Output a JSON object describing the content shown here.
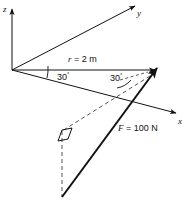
{
  "figure": {
    "background_color": "#ffffff",
    "line_color": "#111111",
    "axes": [
      {
        "name": "z-axis",
        "label": "z",
        "label_x": 4,
        "label_y": 6,
        "x1": 12,
        "y1": 70,
        "x2": 12,
        "y2": 9,
        "arrow": true,
        "dashed": false
      },
      {
        "name": "y-axis",
        "label": "y",
        "label_x": 137,
        "label_y": 9,
        "x1": 12,
        "y1": 70,
        "x2": 135,
        "y2": 6,
        "arrow": true,
        "dashed": false
      },
      {
        "name": "x-axis",
        "label": "x",
        "label_x": 178,
        "label_y": 117,
        "x1": 12,
        "y1": 70,
        "x2": 176,
        "y2": 113,
        "arrow": true,
        "dashed": false
      }
    ],
    "vectors": [
      {
        "name": "position-vector-r",
        "label": "r = 2 m",
        "symbol": "r",
        "expression": " = 2 m",
        "label_x": 68,
        "label_y": 55,
        "x1": 12,
        "y1": 70,
        "x2": 155,
        "y2": 70,
        "arrow": true,
        "dashed": false,
        "width": 1
      },
      {
        "name": "force-vector-F",
        "label": "F = 100 N",
        "symbol": "F",
        "expression": " = 100 N",
        "label_x": 118,
        "label_y": 124,
        "x1": 62,
        "y1": 197,
        "x2": 157,
        "y2": 68,
        "arrow": true,
        "dashed": false,
        "width": 2
      }
    ],
    "angles": [
      {
        "name": "angle-r-from-x-axis",
        "value": "30",
        "unit": "°",
        "label_x": 57,
        "label_y": 71
      },
      {
        "name": "angle-F-from-r",
        "value": "30",
        "unit": "°",
        "label_x": 110,
        "label_y": 72
      }
    ],
    "construction_lines": [
      {
        "name": "projection-diagonal-dashed",
        "x1": 150,
        "y1": 76,
        "x2": 62,
        "y2": 131,
        "dashed": true
      },
      {
        "name": "vertical-drop-dashed",
        "x1": 62,
        "y1": 131,
        "x2": 62,
        "y2": 197,
        "dashed": true
      },
      {
        "name": "angle-leader-dashed",
        "x1": 122,
        "y1": 79,
        "x2": 146,
        "y2": 72,
        "dashed": true
      }
    ],
    "markers": [
      {
        "name": "right-angle-parallelogram",
        "points": "58,141 62,130 72,128 68,139",
        "filled": false
      }
    ],
    "arcs": [
      {
        "name": "arc-30-deg-origin",
        "d": "M 44 74 A 34 34 0 0 0 45 66"
      },
      {
        "name": "arc-30-deg-force",
        "d": "M 119 87 A 23 23 0 0 0 132 79"
      }
    ]
  }
}
